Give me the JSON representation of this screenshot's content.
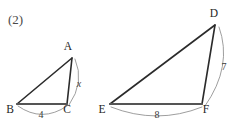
{
  "figure": {
    "problem_number": "(2)",
    "background_color": "#ffffff",
    "stroke_color": "#2b2b2b",
    "arc_color": "#8d8d8d",
    "base_color": "#555555"
  },
  "triangle_small": {
    "name": "triangle-abc",
    "vertices": [
      {
        "label": "A",
        "x": 72,
        "y": 58,
        "label_x": 68,
        "label_y": 50
      },
      {
        "label": "B",
        "x": 17,
        "y": 104,
        "label_x": 8,
        "label_y": 113
      },
      {
        "label": "C",
        "x": 67,
        "y": 104,
        "label_x": 65,
        "label_y": 113
      }
    ],
    "measures": [
      {
        "name": "side-bc-length",
        "value": "4",
        "x": 41,
        "y": 118,
        "italic": false
      },
      {
        "name": "side-ac-unknown",
        "value": "x",
        "x": 79,
        "y": 87,
        "italic": true
      }
    ]
  },
  "triangle_large": {
    "name": "triangle-def",
    "vertices": [
      {
        "label": "D",
        "x": 215,
        "y": 25,
        "label_x": 211,
        "label_y": 17
      },
      {
        "label": "E",
        "x": 110,
        "y": 104,
        "label_x": 100,
        "label_y": 113
      },
      {
        "label": "F",
        "x": 202,
        "y": 104,
        "label_x": 204,
        "label_y": 113
      }
    ],
    "measures": [
      {
        "name": "side-ef-length",
        "value": "8",
        "x": 157,
        "y": 118,
        "italic": false
      },
      {
        "name": "side-df-length",
        "value": "7",
        "x": 224,
        "y": 70,
        "italic": false
      }
    ]
  }
}
